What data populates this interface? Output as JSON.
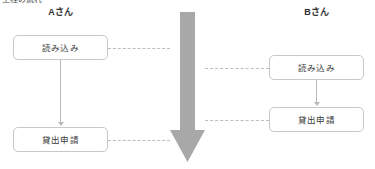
{
  "diagram": {
    "caption_clipped": "工程の流れ",
    "columns": [
      {
        "id": "a",
        "header": "Aさん"
      },
      {
        "id": "b",
        "header": "Bさん"
      }
    ],
    "nodes": [
      {
        "id": "a1",
        "column": "a",
        "label": "読み込み"
      },
      {
        "id": "a2",
        "column": "a",
        "label": "貸出申請"
      },
      {
        "id": "b1",
        "column": "b",
        "label": "読み込み"
      },
      {
        "id": "b2",
        "column": "b",
        "label": "貸出申請"
      }
    ],
    "center_arrow": {
      "name": "time-flow-arrow",
      "direction": "down",
      "color": "#a8a8a8"
    },
    "connectors": {
      "solid_vertical": [
        {
          "from": "a1",
          "to": "a2"
        },
        {
          "from": "b1",
          "to": "b2"
        }
      ],
      "dashed_horizontal": [
        {
          "from": "a1",
          "to": "time-flow-arrow"
        },
        {
          "from": "a2",
          "to": "time-flow-arrow"
        },
        {
          "from": "time-flow-arrow",
          "to": "b1"
        },
        {
          "from": "time-flow-arrow",
          "to": "b2"
        }
      ]
    },
    "colors": {
      "node_border": "#c8c8c8",
      "node_fill": "#ffffff",
      "text": "#3a3a3a",
      "connector": "#bdbdbd",
      "arrow": "#a8a8a8"
    }
  }
}
